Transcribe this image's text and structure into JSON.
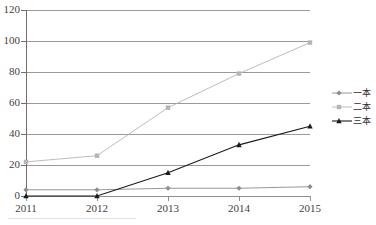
{
  "chart_data": {
    "type": "line",
    "title": "",
    "subtitle": "",
    "xlabel": "",
    "ylabel": "",
    "categories": [
      "2011",
      "2012",
      "2013",
      "2014",
      "2015"
    ],
    "ylim": [
      0,
      120
    ],
    "y_ticks": [
      0,
      20,
      40,
      60,
      80,
      100,
      120
    ],
    "y_tick_labels": [
      "0",
      "20",
      "40",
      "60",
      "80",
      "100",
      "120"
    ],
    "grid": "horizontal",
    "legend_position": "right",
    "series": [
      {
        "name": "一本",
        "marker": "diamond",
        "color": "#8c8c8c",
        "values": [
          4,
          4,
          5,
          5,
          6
        ]
      },
      {
        "name": "二本",
        "marker": "square",
        "color": "#b4b4b4",
        "values": [
          22,
          26,
          57,
          79,
          99
        ]
      },
      {
        "name": "三本",
        "marker": "triangle",
        "color": "#1a1a1a",
        "values": [
          0,
          0,
          15,
          33,
          45
        ]
      }
    ]
  },
  "axes": {
    "y_tick_labels": [
      "120",
      "100",
      "80",
      "60",
      "40",
      "20",
      "0"
    ],
    "x_tick_labels": [
      "2011",
      "2012",
      "2013",
      "2014",
      "2015"
    ]
  },
  "legend": {
    "items": [
      {
        "label": "一本",
        "marker": "diamond-marker-icon",
        "color": "#8c8c8c"
      },
      {
        "label": "二本",
        "marker": "square-marker-icon",
        "color": "#b4b4b4"
      },
      {
        "label": "三本",
        "marker": "triangle-marker-icon",
        "color": "#1a1a1a"
      }
    ]
  },
  "colors": {
    "series_one": "#8c8c8c",
    "series_two": "#b4b4b4",
    "series_three": "#1a1a1a",
    "gridline": "#9a9a9a",
    "axis": "#6e6e6e",
    "text": "#3f3f3f",
    "background": "#ffffff"
  }
}
